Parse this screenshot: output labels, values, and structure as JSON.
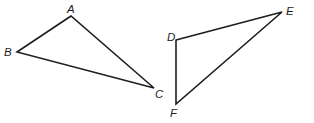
{
  "diagram": {
    "type": "geometry",
    "line_color": "#1e1e1e",
    "background": "#ffffff",
    "triangles": [
      {
        "name": "ABC",
        "vertices": [
          {
            "label": "A",
            "x": 71,
            "y": 16,
            "label_x": 67,
            "label_y": 13
          },
          {
            "label": "B",
            "x": 17,
            "y": 52,
            "label_x": 4,
            "label_y": 56
          },
          {
            "label": "C",
            "x": 154,
            "y": 88,
            "label_x": 155,
            "label_y": 98
          }
        ]
      },
      {
        "name": "DEF",
        "vertices": [
          {
            "label": "D",
            "x": 176,
            "y": 40,
            "label_x": 167,
            "label_y": 41
          },
          {
            "label": "E",
            "x": 282,
            "y": 12,
            "label_x": 286,
            "label_y": 15
          },
          {
            "label": "F",
            "x": 176,
            "y": 104,
            "label_x": 170,
            "label_y": 117
          }
        ]
      }
    ]
  }
}
